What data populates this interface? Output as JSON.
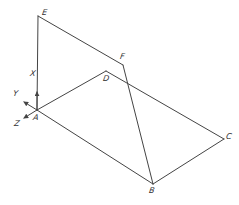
{
  "diagram": {
    "type": "isometric-geometry",
    "stroke_color": "#444444",
    "points": {
      "A": {
        "label": "A",
        "x": 37,
        "y": 110,
        "label_x": 33,
        "label_y": 114
      },
      "B": {
        "label": "B",
        "x": 153,
        "y": 184,
        "label_x": 149,
        "label_y": 187
      },
      "C": {
        "label": "C",
        "x": 224,
        "y": 139,
        "label_x": 226,
        "label_y": 133
      },
      "D": {
        "label": "D",
        "x": 106,
        "y": 71,
        "label_x": 103,
        "label_y": 75
      },
      "E": {
        "label": "E",
        "x": 38,
        "y": 16,
        "label_x": 42,
        "label_y": 9
      },
      "F": {
        "label": "F",
        "x": 123,
        "y": 65,
        "label_x": 120,
        "label_y": 53
      }
    },
    "edges": [
      [
        "E",
        "A"
      ],
      [
        "E",
        "F"
      ],
      [
        "F",
        "B"
      ],
      [
        "A",
        "D"
      ],
      [
        "D",
        "C"
      ],
      [
        "A",
        "B"
      ],
      [
        "B",
        "C"
      ]
    ],
    "axes": {
      "X": {
        "label": "X",
        "label_x": 30,
        "label_y": 70
      },
      "Y": {
        "label": "Y",
        "label_x": 13,
        "label_y": 90
      },
      "Z": {
        "label": "Z",
        "label_x": 14,
        "label_y": 120
      }
    }
  }
}
